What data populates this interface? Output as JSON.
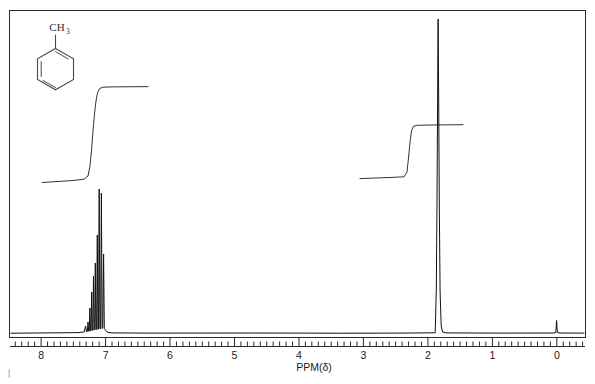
{
  "figure": {
    "kind": "nmr-spectrum",
    "compound_name": "toluene",
    "molecule_label": "CH",
    "molecule_label_sub": "3",
    "caption_mark": "|"
  },
  "axis": {
    "title": "PPM(δ)",
    "unit": "ppm",
    "direction": "right-to-left",
    "min": 0,
    "max": 8,
    "tick_labels": [
      "8",
      "7",
      "6",
      "5",
      "4",
      "3",
      "2",
      "1",
      "0"
    ],
    "tick_values": [
      8,
      7,
      6,
      5,
      4,
      3,
      2,
      1,
      0
    ],
    "minor_tick_step": 0.1
  },
  "chart_data": {
    "type": "line",
    "title": "",
    "subtitle": "",
    "xlabel": "PPM(δ)",
    "ylabel": "",
    "xlim": [
      8.45,
      -0.45
    ],
    "ylim": [
      0,
      1
    ],
    "grid": false,
    "legend": "none",
    "annotations": [
      "CH3",
      "toluene ring"
    ],
    "series": [
      {
        "name": "spectrum",
        "peaks": [
          {
            "label": "aromatic-H",
            "shift": 7.28,
            "height": 0.98,
            "width": 0.012,
            "assignment": "C6H5"
          },
          {
            "label": "aromatic-H",
            "shift": 7.24,
            "height": 0.62,
            "width": 0.012,
            "assignment": "C6H5"
          },
          {
            "label": "aromatic-H",
            "shift": 7.21,
            "height": 0.52,
            "width": 0.012,
            "assignment": "C6H5"
          },
          {
            "label": "aromatic-H",
            "shift": 7.18,
            "height": 0.44,
            "width": 0.012,
            "assignment": "C6H5"
          },
          {
            "label": "aromatic-H",
            "shift": 7.15,
            "height": 0.33,
            "width": 0.012,
            "assignment": "C6H5"
          },
          {
            "label": "aromatic-H",
            "shift": 7.12,
            "height": 0.22,
            "width": 0.012,
            "assignment": "C6H5"
          },
          {
            "label": "aromatic-H",
            "shift": 7.09,
            "height": 0.14,
            "width": 0.012,
            "assignment": "C6H5"
          },
          {
            "label": "methyl-H",
            "shift": 2.32,
            "height": 1.0,
            "width": 0.012,
            "assignment": "CH3"
          },
          {
            "label": "TMS",
            "shift": 0.0,
            "height": 0.035,
            "width": 0.012,
            "assignment": "reference"
          }
        ]
      },
      {
        "name": "integration",
        "steps": [
          {
            "label": "aromatic-integral",
            "start_shift": 8.05,
            "end_shift": 6.85,
            "rise": 0.295,
            "protons": 5
          },
          {
            "label": "methyl-integral",
            "start_shift": 3.1,
            "end_shift": 1.6,
            "rise": 0.163,
            "protons": 3
          }
        ]
      }
    ]
  }
}
